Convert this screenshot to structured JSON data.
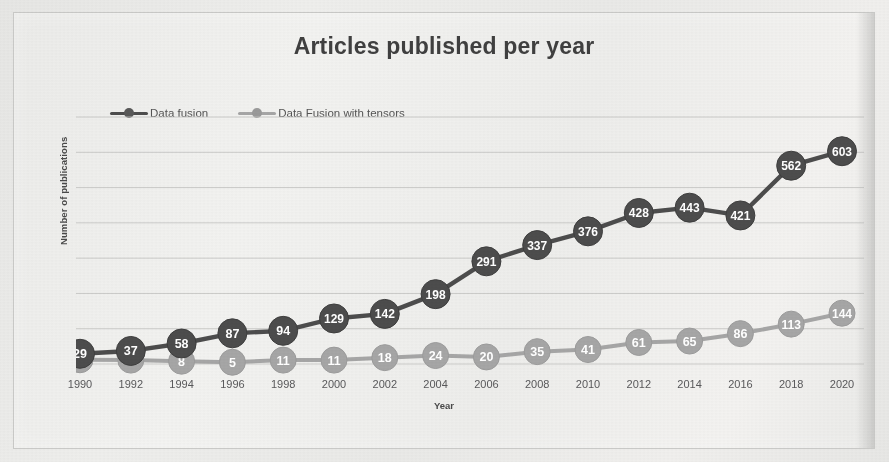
{
  "chart_data": {
    "type": "line",
    "title": "Articles published per year",
    "xlabel": "Year",
    "ylabel": "Number of publications",
    "grid": true,
    "legend_position": "top-left",
    "x": [
      1990,
      1992,
      1994,
      1996,
      1998,
      2000,
      2002,
      2004,
      2006,
      2008,
      2010,
      2012,
      2014,
      2016,
      2018,
      2020
    ],
    "categories": [
      "1990",
      "1992",
      "1994",
      "1996",
      "1998",
      "2000",
      "2002",
      "2004",
      "2006",
      "2008",
      "2010",
      "2012",
      "2014",
      "2016",
      "2018",
      "2020"
    ],
    "ylim": [
      0,
      700
    ],
    "xlim": [
      1990,
      2020
    ],
    "gridline_values": [
      0,
      100,
      200,
      300,
      400,
      500,
      600,
      700
    ],
    "series": [
      {
        "name": "Data fusion",
        "color": "#4d4d4d",
        "marker": "circle",
        "values": [
          29,
          37,
          58,
          87,
          94,
          129,
          142,
          198,
          291,
          337,
          376,
          428,
          443,
          421,
          562,
          603
        ],
        "labels": [
          "29",
          "37",
          "58",
          "87",
          "94",
          "129",
          "142",
          "198",
          "291",
          "337",
          "376",
          "428",
          "443",
          "421",
          "562",
          "603"
        ]
      },
      {
        "name": "Data Fusion with tensors",
        "color": "#a6a6a6",
        "marker": "circle",
        "values": [
          12,
          11,
          8,
          5,
          11,
          11,
          18,
          24,
          20,
          35,
          41,
          61,
          65,
          86,
          113,
          144
        ],
        "labels": [
          "12",
          "11",
          "8",
          "5",
          "11",
          "11",
          "18",
          "24",
          "20",
          "35",
          "41",
          "61",
          "65",
          "86",
          "113",
          "144"
        ]
      }
    ]
  },
  "legend": {
    "items": [
      {
        "label": "Data fusion",
        "color": "#4d4d4d"
      },
      {
        "label": "Data Fusion with tensors",
        "color": "#a6a6a6"
      }
    ]
  },
  "colors": {
    "series_dark": "#4d4d4d",
    "series_light": "#a6a6a6",
    "title_text": "#404040",
    "axis_text": "#59595b",
    "gridline": "#c4c4c2",
    "card_background": "#efefed",
    "card_border": "#c9c9c7",
    "page_background": "#e8e8e6",
    "label_text": "#ffffff"
  }
}
